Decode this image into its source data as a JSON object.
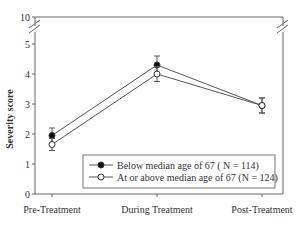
{
  "chart_data": {
    "type": "line",
    "title": "",
    "xlabel": "",
    "ylabel": "Severity score",
    "categories": [
      "Pre-Treatment",
      "During Treatment",
      "Post-Treatment"
    ],
    "ylim": [
      0,
      10
    ],
    "axis_break": {
      "from": 5,
      "to": 10
    },
    "yticks": [
      0,
      1,
      2,
      3,
      4,
      5,
      10
    ],
    "grid": false,
    "legend_position": "bottom-right",
    "series": [
      {
        "name": "Below median age of 67 ( N = 114)",
        "marker": "filled-circle",
        "values": [
          1.95,
          4.3,
          2.95
        ],
        "error": [
          0.25,
          0.3,
          0.25
        ]
      },
      {
        "name": "At or above median age of 67 (N = 124)",
        "marker": "open-circle",
        "values": [
          1.65,
          4.0,
          2.95
        ],
        "error": [
          0.2,
          0.25,
          0.25
        ]
      }
    ]
  }
}
